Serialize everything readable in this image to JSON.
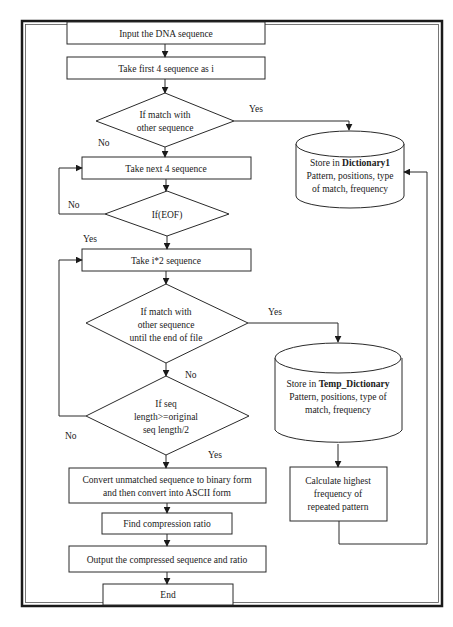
{
  "diagram": {
    "type": "flowchart",
    "nodes": {
      "input": {
        "kind": "process",
        "lines": [
          "Input the DNA sequence"
        ]
      },
      "take_first": {
        "kind": "process",
        "lines": [
          "Take first 4 sequence as i"
        ]
      },
      "match1": {
        "kind": "decision",
        "lines": [
          "If match with",
          "other sequence"
        ]
      },
      "take_next": {
        "kind": "process",
        "lines": [
          "Take next 4 sequence"
        ]
      },
      "eof": {
        "kind": "decision",
        "lines": [
          "If(EOF)"
        ]
      },
      "take_i2": {
        "kind": "process",
        "lines": [
          "Take i*2 sequence"
        ]
      },
      "match2": {
        "kind": "decision",
        "lines": [
          "If match with",
          "other sequence",
          "until the end of file"
        ]
      },
      "seqlen": {
        "kind": "decision",
        "lines": [
          "If seq",
          "length>=original",
          "seq length/2"
        ]
      },
      "convert": {
        "kind": "process",
        "lines": [
          "Convert unmatched sequence to binary form",
          "and then convert into ASCII form"
        ]
      },
      "ratio": {
        "kind": "process",
        "lines": [
          "Find compression ratio"
        ]
      },
      "output": {
        "kind": "process",
        "lines": [
          "Output the compressed sequence and ratio"
        ]
      },
      "end": {
        "kind": "terminal",
        "lines": [
          "End"
        ]
      },
      "dict1": {
        "kind": "storage",
        "title_prefix": "Store in ",
        "title_bold": "Dictionary1",
        "lines": [
          "Pattern, positions, type",
          "of match, frequency"
        ]
      },
      "tempdict": {
        "kind": "storage",
        "title_prefix": "Store in ",
        "title_bold": "Temp_Dictionary",
        "lines": [
          "Pattern, positions, type of",
          "match, frequency"
        ]
      },
      "calc": {
        "kind": "process",
        "lines": [
          "Calculate highest",
          "frequency of",
          "repeated pattern"
        ]
      }
    },
    "edge_labels": {
      "match1_yes": "Yes",
      "match1_no": "No",
      "eof_no": "No",
      "eof_yes": "Yes",
      "match2_yes": "Yes",
      "match2_no": "No",
      "seqlen_no": "No",
      "seqlen_yes": "Yes"
    },
    "edges": [
      {
        "from": "input",
        "to": "take_first"
      },
      {
        "from": "take_first",
        "to": "match1"
      },
      {
        "from": "match1",
        "to": "dict1",
        "label": "Yes"
      },
      {
        "from": "match1",
        "to": "take_next",
        "label": "No"
      },
      {
        "from": "take_next",
        "to": "eof"
      },
      {
        "from": "eof",
        "to": "take_next",
        "label": "No"
      },
      {
        "from": "eof",
        "to": "take_i2",
        "label": "Yes"
      },
      {
        "from": "take_i2",
        "to": "match2"
      },
      {
        "from": "match2",
        "to": "tempdict",
        "label": "Yes"
      },
      {
        "from": "match2",
        "to": "seqlen",
        "label": "No"
      },
      {
        "from": "seqlen",
        "to": "take_i2",
        "label": "No"
      },
      {
        "from": "seqlen",
        "to": "convert",
        "label": "Yes"
      },
      {
        "from": "tempdict",
        "to": "calc"
      },
      {
        "from": "calc",
        "to": "dict1"
      },
      {
        "from": "convert",
        "to": "ratio"
      },
      {
        "from": "ratio",
        "to": "output"
      },
      {
        "from": "output",
        "to": "end"
      }
    ]
  }
}
